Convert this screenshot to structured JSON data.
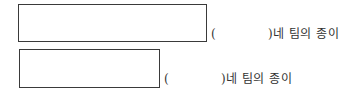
{
  "rows": [
    {
      "paren_open": "(",
      "suffix": ")네 팀의 종이"
    },
    {
      "paren_open": "(",
      "suffix": ")네 팀의 종이"
    }
  ]
}
